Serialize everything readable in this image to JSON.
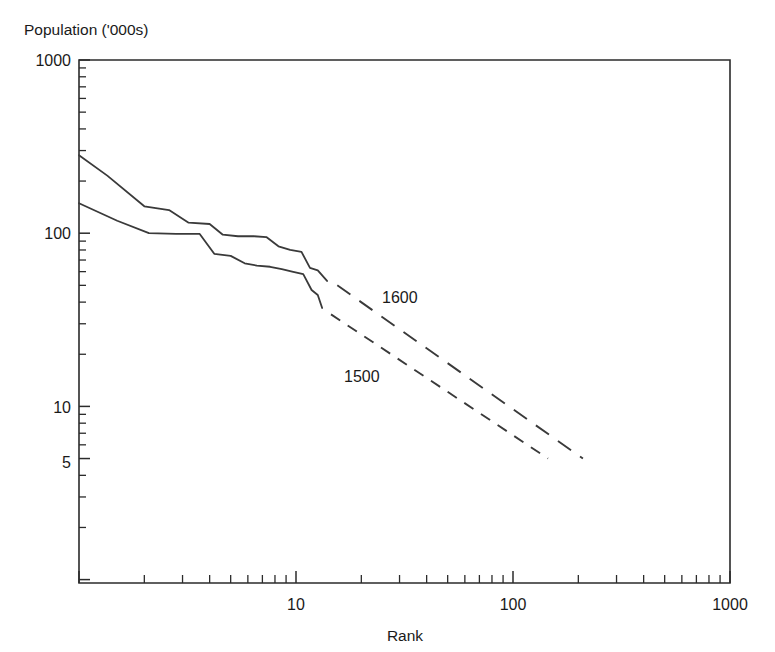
{
  "figure": {
    "background_color": "#ffffff",
    "ink_color": "#2b2b2b",
    "curve_color": "#3a3a3a"
  },
  "axes": {
    "y_axis_title": "Population ('000s)",
    "x_axis_title": "Rank",
    "y_tick_labels": [
      "1000",
      "100",
      "10",
      "5"
    ],
    "x_tick_labels": [
      "10",
      "100",
      "1000"
    ]
  },
  "annotations": {
    "upper_curve_label": "1600",
    "lower_curve_label": "1500"
  },
  "chart_data": {
    "type": "line",
    "title": "",
    "subtitle": "",
    "xlabel": "Rank",
    "ylabel": "Population ('000s)",
    "xscale": "log",
    "yscale": "log",
    "xlim": [
      1,
      1000
    ],
    "ylim": [
      1,
      1000
    ],
    "grid": false,
    "legend": "inline-annotations",
    "x_ticks_major": [
      10,
      100,
      1000
    ],
    "x_ticks_major_labels": [
      "10",
      "100",
      "1000"
    ],
    "y_ticks_major": [
      1000,
      100,
      10,
      5
    ],
    "y_ticks_major_labels": [
      "1000",
      "100",
      "10",
      "5"
    ],
    "series": [
      {
        "name": "1600",
        "label": "1600",
        "style": "solid-then-dashed",
        "solid_segment": {
          "x": [
            1.0,
            1.35,
            2.0,
            2.6,
            3.2,
            4.0,
            4.6,
            5.4,
            6.4,
            7.3,
            8.3,
            9.4,
            10.6,
            11.6,
            12.6,
            13.9
          ],
          "y": [
            282,
            215,
            143,
            136,
            115,
            113,
            98,
            96,
            96,
            95,
            84,
            80,
            78,
            63,
            61,
            53
          ]
        },
        "dashed_segment": {
          "x": [
            15.5,
            210
          ],
          "y": [
            50,
            5.0
          ]
        }
      },
      {
        "name": "1500",
        "label": "1500",
        "style": "solid-then-dashed",
        "solid_segment": {
          "x": [
            1.0,
            1.5,
            2.1,
            2.8,
            3.6,
            4.2,
            5.0,
            5.8,
            6.6,
            7.6,
            8.6,
            9.6,
            10.8,
            11.8,
            12.6,
            13.2
          ],
          "y": [
            149,
            118,
            100,
            99,
            99,
            76,
            74,
            67,
            65,
            64,
            62,
            60,
            58,
            47,
            44,
            37
          ]
        },
        "dashed_segment": {
          "x": [
            14.5,
            145
          ],
          "y": [
            34,
            5.0
          ]
        }
      }
    ],
    "annotations": [
      {
        "text": "1600",
        "x": 23,
        "y": 43
      },
      {
        "text": "1500",
        "x": 17,
        "y": 16
      }
    ]
  }
}
